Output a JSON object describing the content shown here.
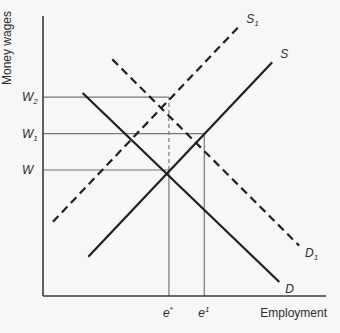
{
  "chart_data": {
    "type": "line",
    "title": "",
    "xlabel": "Employment",
    "ylabel": "Money wages",
    "xlim": [
      0,
      10
    ],
    "ylim": [
      0,
      10
    ],
    "grid": false,
    "legend": "none",
    "series": [
      {
        "name": "D",
        "label": "D",
        "label_sub": "",
        "style": "solid",
        "kind": "demand",
        "points": [
          [
            1.4,
            7.25
          ],
          [
            8.35,
            0.5
          ]
        ]
      },
      {
        "name": "S",
        "label": "S",
        "label_sub": "",
        "style": "solid",
        "kind": "supply",
        "points": [
          [
            1.6,
            1.4
          ],
          [
            8.1,
            8.35
          ]
        ]
      },
      {
        "name": "D1",
        "label": "D",
        "label_sub": "1",
        "style": "dashed",
        "kind": "demand",
        "points": [
          [
            2.45,
            8.45
          ],
          [
            9.05,
            1.8
          ]
        ]
      },
      {
        "name": "S1",
        "label": "S",
        "label_sub": "1",
        "style": "dashed",
        "kind": "supply",
        "points": [
          [
            0.35,
            2.65
          ],
          [
            6.9,
            9.6
          ]
        ]
      }
    ],
    "y_ticks": [
      {
        "label": "W",
        "sub": "",
        "value": 4.5
      },
      {
        "label": "W",
        "sub": "1",
        "value": 5.8
      },
      {
        "label": "W",
        "sub": "2",
        "value": 7.1
      }
    ],
    "x_ticks": [
      {
        "label": "e",
        "sup": "*",
        "value": 4.45
      },
      {
        "label": "e",
        "sup": "1",
        "value": 5.7
      }
    ],
    "guides": [
      {
        "name": "w-line",
        "axis": "y",
        "value": 4.5,
        "to_x": 4.45,
        "style": "solid"
      },
      {
        "name": "w1-line",
        "axis": "y",
        "value": 5.8,
        "to_x": 5.7,
        "style": "solid"
      },
      {
        "name": "w2-line",
        "axis": "y",
        "value": 7.1,
        "to_x": 4.45,
        "style": "solid"
      },
      {
        "name": "e-star-line-lower",
        "axis": "x",
        "value": 4.45,
        "from_y": 0,
        "to_y": 4.5,
        "style": "solid"
      },
      {
        "name": "e-star-line-upper",
        "axis": "x",
        "value": 4.45,
        "from_y": 4.5,
        "to_y": 7.1,
        "style": "dashed"
      },
      {
        "name": "e1-line",
        "axis": "x",
        "value": 5.7,
        "from_y": 0,
        "to_y": 5.8,
        "style": "solid"
      }
    ]
  }
}
